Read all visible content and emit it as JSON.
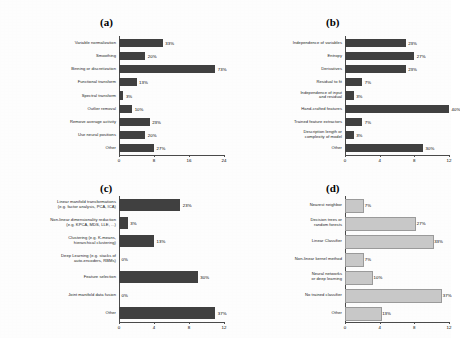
{
  "figure": {
    "background_color": "#fdfdfd",
    "bar_color_dark": "#404040",
    "bar_color_light": "#c8c8c8"
  },
  "chart_data": [
    {
      "type": "bar",
      "orientation": "horizontal",
      "panel": "(a)",
      "title": "(a)",
      "xlabel": "",
      "ylabel": "",
      "xlim": [
        0,
        24
      ],
      "ticks": [
        0,
        8,
        16,
        24
      ],
      "tick_labels": [
        "0",
        "8",
        "16",
        "24"
      ],
      "grid": false,
      "legend": "none",
      "bar_color": "#404040",
      "categories": [
        "Variable normalization",
        "Smoothing",
        "Binning or discretization",
        "Functional transform",
        "Spectral transform",
        "Outlier removal",
        "Remove average activity",
        "Use neural positions",
        "Other"
      ],
      "values": [
        10,
        6,
        22,
        4,
        1,
        3,
        7,
        6,
        8
      ],
      "data_labels": [
        "33%",
        "20%",
        "73%",
        "13%",
        "3%",
        "10%",
        "23%",
        "20%",
        "27%"
      ]
    },
    {
      "type": "bar",
      "orientation": "horizontal",
      "panel": "(b)",
      "title": "(b)",
      "xlabel": "",
      "ylabel": "",
      "xlim": [
        0,
        12
      ],
      "ticks": [
        0,
        4,
        8,
        12
      ],
      "tick_labels": [
        "0",
        "4",
        "8",
        "12"
      ],
      "grid": false,
      "legend": "none",
      "bar_color": "#404040",
      "categories": [
        "Independence of variables",
        "Entropy",
        "Derivatives",
        "Residual to fit",
        "Independence of input\nand residual",
        "Hand-crafted features",
        "Trained feature extractors",
        "Description length or\ncomplexity of model",
        "Other"
      ],
      "values": [
        7,
        8,
        7,
        2,
        1,
        12,
        2,
        1,
        9
      ],
      "data_labels": [
        "23%",
        "27%",
        "23%",
        "7%",
        "3%",
        "40%",
        "7%",
        "3%",
        "30%"
      ]
    },
    {
      "type": "bar",
      "orientation": "horizontal",
      "panel": "(c)",
      "title": "(c)",
      "xlabel": "",
      "ylabel": "",
      "xlim": [
        0,
        12
      ],
      "ticks": [
        0,
        4,
        8,
        12
      ],
      "tick_labels": [
        "0",
        "4",
        "8",
        "12"
      ],
      "grid": false,
      "legend": "none",
      "bar_color": "#404040",
      "categories": [
        "Linear manifold transformations\n(e.g. factor analysis, PCA, ICA)",
        "Non-linear dimensionality reduction\n(e.g. KPCA, MDS, LLE, ...)",
        "Clustering (e.g. K-means,\nhierarchical clustering)",
        "Deep Learning (e.g. stacks of\nauto-encoders, RBMs)",
        "Feature selection",
        "Joint manifold data fusion",
        "Other"
      ],
      "values": [
        7,
        1,
        4,
        0,
        9,
        0,
        11
      ],
      "data_labels": [
        "23%",
        "3%",
        "13%",
        "0%",
        "30%",
        "0%",
        "37%"
      ]
    },
    {
      "type": "bar",
      "orientation": "horizontal",
      "panel": "(d)",
      "title": "(d)",
      "xlabel": "",
      "ylabel": "",
      "xlim": [
        0,
        12
      ],
      "ticks": [
        0,
        4,
        8,
        12
      ],
      "tick_labels": [
        "0",
        "4",
        "8",
        "12"
      ],
      "grid": false,
      "legend": "none",
      "bar_color": "#c8c8c8",
      "categories": [
        "Nearest neighbor",
        "Decision trees or\nrandom forests",
        "Linear Classifier",
        "Non-linear kernel method",
        "Neural networks\nor deep learning",
        "No trained classifier",
        "Other"
      ],
      "values": [
        2,
        8,
        10,
        2,
        3,
        11,
        4
      ],
      "data_labels": [
        "7%",
        "27%",
        "33%",
        "7%",
        "10%",
        "37%",
        "13%"
      ]
    }
  ]
}
